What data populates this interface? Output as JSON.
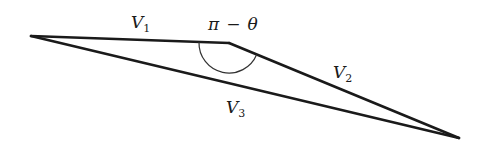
{
  "diagram": {
    "title": "",
    "vertices": {
      "A": {
        "x": 31,
        "y": 36
      },
      "B": {
        "x": 229,
        "y": 43
      },
      "C": {
        "x": 459,
        "y": 138
      }
    },
    "edges": [
      {
        "name": "V1",
        "from": "A",
        "to": "B",
        "label_main": "V",
        "label_sub": "1"
      },
      {
        "name": "V2",
        "from": "B",
        "to": "C",
        "label_main": "V",
        "label_sub": "2"
      },
      {
        "name": "V3",
        "from": "A",
        "to": "C",
        "label_main": "V",
        "label_sub": "3"
      }
    ],
    "angle": {
      "at": "B",
      "label_pi": "π",
      "label_minus": "−",
      "label_theta": "θ",
      "label": "π − θ"
    },
    "colors": {
      "stroke": "#1a1a1a",
      "arc": "#333333",
      "background": "#ffffff"
    }
  }
}
